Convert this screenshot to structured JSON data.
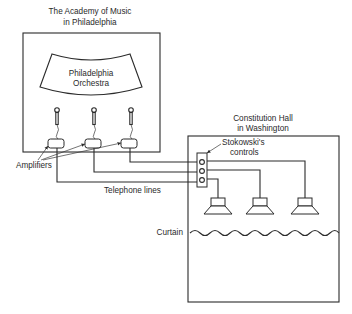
{
  "diagram": {
    "left_venue": {
      "title_line1": "The Academy of Music",
      "title_line2": "in Philadelphia",
      "stage_label_line1": "Philadelphia",
      "stage_label_line2": "Orchestra",
      "microphones": 3,
      "amplifiers": 3
    },
    "right_venue": {
      "title_line1": "Constitution Hall",
      "title_line2": "in Washington",
      "controls_label_line1": "Stokowski's",
      "controls_label_line2": "controls",
      "speakers": 3,
      "curtain_label": "Curtain"
    },
    "labels": {
      "amplifiers": "Amplifiers",
      "telephone_lines": "Telephone lines"
    },
    "colors": {
      "line": "#2b2b2b",
      "text": "#2a2a2a",
      "background": "#ffffff"
    }
  }
}
